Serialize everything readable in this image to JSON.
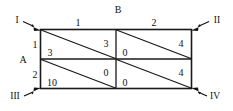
{
  "diagram": {
    "type": "payoff-matrix-grid",
    "row_axis_title": "A",
    "col_axis_title": "B",
    "row_labels": [
      "1",
      "2"
    ],
    "col_labels": [
      "1",
      "2"
    ],
    "corner_markers": [
      {
        "label": "I",
        "position": "top-left",
        "arrow": "down-right"
      },
      {
        "label": "II",
        "position": "top-right",
        "arrow": "down-left"
      },
      {
        "label": "III",
        "position": "bottom-left",
        "arrow": "up-right"
      },
      {
        "label": "IV",
        "position": "bottom-right",
        "arrow": "up-left"
      }
    ],
    "cells": [
      {
        "row": "1",
        "col": "1",
        "upper_right_value": "3",
        "lower_left_value": "3",
        "diagonal": "top-left-to-bottom-right"
      },
      {
        "row": "1",
        "col": "2",
        "upper_right_value": "4",
        "lower_left_value": "0",
        "diagonal": "top-left-to-bottom-right"
      },
      {
        "row": "2",
        "col": "1",
        "upper_right_value": "0",
        "lower_left_value": "10",
        "diagonal": "top-left-to-bottom-right"
      },
      {
        "row": "2",
        "col": "2",
        "upper_right_value": "4",
        "lower_left_value": "0",
        "diagonal": "top-left-to-bottom-right"
      }
    ]
  },
  "colors": {
    "ink": "#111111",
    "line": "#1a1a1a",
    "background": "#ffffff"
  }
}
